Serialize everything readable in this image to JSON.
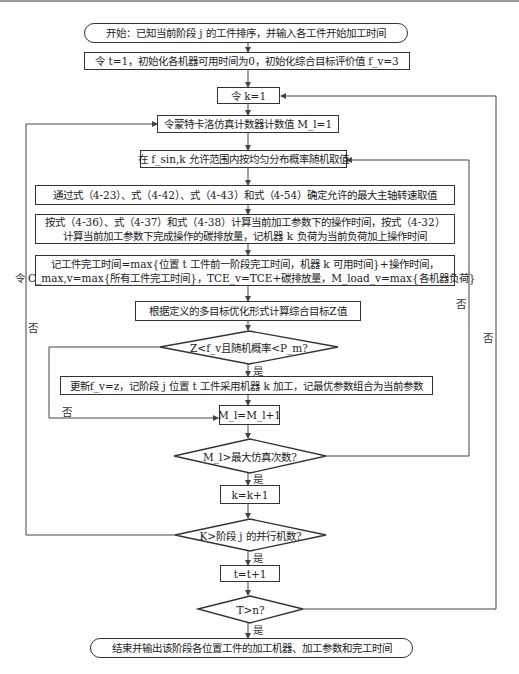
{
  "flowchart": {
    "start": "开始：已知当前阶段 j 的工件排序，并输入各工件开始加工时间",
    "init": "令 t=1，初始化各机器可用时间为0，初始化综合目标评价值 f_v=3",
    "set_k": "令 k=1",
    "set_mc": "令蒙特卡洛仿真计数器计数值 M_l=1",
    "random_pick": "在 f_sin,k 允许范围内按均匀分布概率随机取值",
    "max_spindle": "通过式（4-23）、式（4-42）、式（4-43）和式（4-54）确定允许的最大主轴转速取值",
    "calc_ops": [
      "按式（4-36）、式（4-37）和式（4-38）计算当前加工参数下的操作时间，按式（4-32）",
      "计算当前加工参数下完成操作的碳排放量，记机器 k 负荷为当前负荷加上操作时间"
    ],
    "record_finish": [
      "记工件完工时间=max{位置 t 工件前一阶段完工时间，机器 k 可用时间}+操作时间，",
      "令 C_max,v=max{所有工件完工时间}，TCE_v=TCE+碳排放量，M_load_v=max{各机器负荷}"
    ],
    "calc_z": "根据定义的多目标优化形式计算综合目标Z值",
    "decision_z": "Z<f_v且随机概率<P_m?",
    "update": "更新f_v=z，记阶段 j 位置 t 工件采用机器 k 加工，记最优参数组合为当前参数",
    "inc_mc": "M_l=M_l+1",
    "decision_mc": "M_l>最大仿真次数?",
    "inc_k": "k=k+1",
    "decision_k": "K>阶段 j 的并行机数?",
    "inc_t": "t=t+1",
    "decision_t": "T>n?",
    "end": "结束并输出该阶段各位置工件的加工机器、加工参数和完工时间"
  },
  "edge_labels": {
    "yes": "是",
    "no": "否"
  },
  "colors": {
    "line": "#444444",
    "border": "#333333",
    "text": "#222222",
    "background": "#ffffff"
  }
}
